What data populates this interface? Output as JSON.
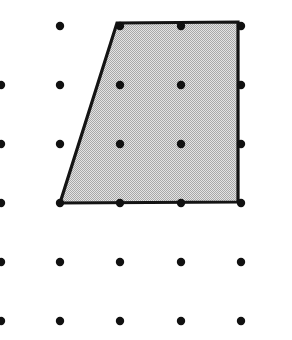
{
  "figure": {
    "kind": "geoboard-dot-grid-polygon",
    "width": 292,
    "height": 340,
    "background_color": "#ffffff"
  },
  "chart_data": {
    "type": "scatter",
    "subtitle": "",
    "xlabel": "",
    "ylabel": "",
    "grid": false,
    "legend_position": "none",
    "xlim": [
      1,
      241
    ],
    "ylim": [
      26,
      321
    ],
    "axis_tick_labels": {
      "x": [],
      "y": []
    },
    "annotations": [],
    "grid_spec": {
      "columns": 5,
      "rows": 6,
      "column_x": [
        1,
        60,
        120,
        181,
        241
      ],
      "row_y": [
        26,
        85,
        144,
        203,
        262,
        321
      ],
      "spacing_x": 60,
      "spacing_y": 59,
      "dot_radius": 4.2,
      "dot_color": "#111111",
      "note_left_column_clipped": true
    },
    "points": [
      {
        "x": 1,
        "y": 26,
        "visible": false
      },
      {
        "x": 60,
        "y": 26,
        "visible": true
      },
      {
        "x": 120,
        "y": 26,
        "visible": true,
        "on_shape": "vertex"
      },
      {
        "x": 181,
        "y": 26,
        "visible": true,
        "on_shape": "edge-top"
      },
      {
        "x": 241,
        "y": 26,
        "visible": true,
        "on_shape": "vertex"
      },
      {
        "x": 1,
        "y": 85,
        "visible": true
      },
      {
        "x": 60,
        "y": 85,
        "visible": true
      },
      {
        "x": 120,
        "y": 85,
        "visible": true,
        "on_shape": "interior"
      },
      {
        "x": 181,
        "y": 85,
        "visible": true,
        "on_shape": "interior"
      },
      {
        "x": 241,
        "y": 85,
        "visible": true,
        "on_shape": "edge-right"
      },
      {
        "x": 1,
        "y": 144,
        "visible": true
      },
      {
        "x": 60,
        "y": 144,
        "visible": true
      },
      {
        "x": 120,
        "y": 144,
        "visible": true,
        "on_shape": "interior"
      },
      {
        "x": 181,
        "y": 144,
        "visible": true,
        "on_shape": "interior"
      },
      {
        "x": 241,
        "y": 144,
        "visible": true,
        "on_shape": "edge-right"
      },
      {
        "x": 1,
        "y": 203,
        "visible": true
      },
      {
        "x": 60,
        "y": 203,
        "visible": true,
        "on_shape": "vertex"
      },
      {
        "x": 120,
        "y": 203,
        "visible": true,
        "on_shape": "edge-bottom"
      },
      {
        "x": 181,
        "y": 203,
        "visible": true,
        "on_shape": "edge-bottom"
      },
      {
        "x": 241,
        "y": 203,
        "visible": true,
        "on_shape": "vertex"
      },
      {
        "x": 1,
        "y": 262,
        "visible": true
      },
      {
        "x": 60,
        "y": 262,
        "visible": true
      },
      {
        "x": 120,
        "y": 262,
        "visible": true
      },
      {
        "x": 181,
        "y": 262,
        "visible": true
      },
      {
        "x": 241,
        "y": 262,
        "visible": true
      },
      {
        "x": 1,
        "y": 321,
        "visible": true
      },
      {
        "x": 60,
        "y": 321,
        "visible": true
      },
      {
        "x": 120,
        "y": 321,
        "visible": true
      },
      {
        "x": 181,
        "y": 321,
        "visible": true
      },
      {
        "x": 241,
        "y": 321,
        "visible": true
      }
    ],
    "shapes": [
      {
        "name": "shaded-trapezoid",
        "type": "polygon",
        "vertices": [
          {
            "x": 117,
            "y": 23,
            "label": "top-left"
          },
          {
            "x": 238,
            "y": 22,
            "label": "top-right"
          },
          {
            "x": 238,
            "y": 202,
            "label": "bottom-right"
          },
          {
            "x": 60,
            "y": 203,
            "label": "bottom-left"
          }
        ],
        "points_string": "117,23 238,22 238,202 60,203",
        "fill_color": "#c9c9c9",
        "fill_style": "dithered-halftone-gray",
        "stroke_color": "#141414",
        "stroke_width": 3.2,
        "grid_units": {
          "top_base": 2,
          "bottom_base": 3,
          "height": 3,
          "area": 7.5
        }
      }
    ]
  }
}
